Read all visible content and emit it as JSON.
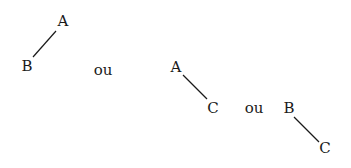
{
  "diagram": {
    "trees": [
      {
        "parent": "A",
        "child": "B"
      },
      {
        "parent": "A",
        "child": "C"
      },
      {
        "parent": "B",
        "child": "C"
      }
    ],
    "separator": "ou",
    "nodes": {
      "t1_a": "A",
      "t1_b": "B",
      "t2_a": "A",
      "t2_c": "C",
      "t3_b": "B",
      "t3_c": "C"
    },
    "separators": [
      "ou",
      "ou"
    ],
    "line_color": "#1a1a1a"
  }
}
